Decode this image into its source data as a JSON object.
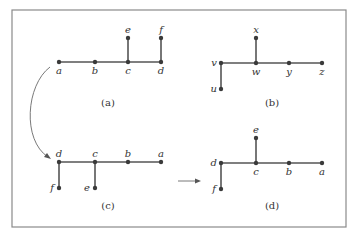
{
  "panels": [
    {
      "id": "a",
      "caption": "(a)",
      "nodes": [
        {
          "id": "a",
          "label": "a"
        },
        {
          "id": "b",
          "label": "b"
        },
        {
          "id": "c",
          "label": "c"
        },
        {
          "id": "d",
          "label": "d"
        },
        {
          "id": "e",
          "label": "e"
        },
        {
          "id": "f",
          "label": "f"
        }
      ],
      "edges": [
        [
          "a",
          "b"
        ],
        [
          "b",
          "c"
        ],
        [
          "c",
          "d"
        ],
        [
          "c",
          "e"
        ],
        [
          "d",
          "f"
        ]
      ]
    },
    {
      "id": "b",
      "caption": "(b)",
      "nodes": [
        {
          "id": "v",
          "label": "v"
        },
        {
          "id": "w",
          "label": "w"
        },
        {
          "id": "y",
          "label": "y"
        },
        {
          "id": "z",
          "label": "z"
        },
        {
          "id": "x",
          "label": "x"
        },
        {
          "id": "u",
          "label": "u"
        }
      ],
      "edges": [
        [
          "v",
          "w"
        ],
        [
          "w",
          "y"
        ],
        [
          "y",
          "z"
        ],
        [
          "w",
          "x"
        ],
        [
          "v",
          "u"
        ]
      ]
    },
    {
      "id": "c",
      "caption": "(c)",
      "nodes": [
        {
          "id": "d",
          "label": "d"
        },
        {
          "id": "c",
          "label": "c"
        },
        {
          "id": "b",
          "label": "b"
        },
        {
          "id": "a",
          "label": "a"
        },
        {
          "id": "f",
          "label": "f"
        },
        {
          "id": "e",
          "label": "e"
        }
      ],
      "edges": [
        [
          "d",
          "c"
        ],
        [
          "c",
          "b"
        ],
        [
          "b",
          "a"
        ],
        [
          "d",
          "f"
        ],
        [
          "c",
          "e"
        ]
      ]
    },
    {
      "id": "d",
      "caption": "(d)",
      "nodes": [
        {
          "id": "d",
          "label": "d"
        },
        {
          "id": "c",
          "label": "c"
        },
        {
          "id": "b",
          "label": "b"
        },
        {
          "id": "a",
          "label": "a"
        },
        {
          "id": "e",
          "label": "e"
        },
        {
          "id": "f",
          "label": "f"
        }
      ],
      "edges": [
        [
          "d",
          "c"
        ],
        [
          "c",
          "b"
        ],
        [
          "b",
          "a"
        ],
        [
          "c",
          "e"
        ],
        [
          "d",
          "f"
        ]
      ]
    }
  ],
  "arrows": [
    {
      "from": "a",
      "to": "c",
      "style": "curved"
    },
    {
      "from": "c",
      "to": "d",
      "style": "straight"
    }
  ]
}
